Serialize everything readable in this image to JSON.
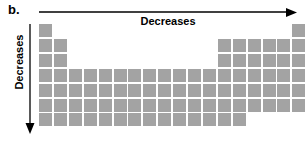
{
  "figure": {
    "panel_label": "b.",
    "horizontal_arrow": {
      "label": "Decreases",
      "direction": "right",
      "icon": "arrow-right-icon"
    },
    "vertical_arrow": {
      "label": "Decreases",
      "direction": "down",
      "icon": "arrow-down-icon"
    }
  },
  "chart_data": {
    "type": "heatmap",
    "title": "",
    "subtitle": "",
    "xlabel": "Decreases",
    "ylabel": "Decreases",
    "legend": [],
    "annotations": [
      "b.",
      "Decreases",
      "Decreases"
    ],
    "grid": false,
    "columns": 18,
    "rows": 7,
    "cell_color": "#a3a3a3",
    "background_color": "#ffffff",
    "cell_size_px": 13,
    "cell_pitch_px": 14.9,
    "origin_px": [
      39,
      24
    ],
    "row_occupancy": [
      {
        "row": 1,
        "columns": [
          1,
          18
        ]
      },
      {
        "row": 2,
        "columns": [
          1,
          2,
          13,
          14,
          15,
          16,
          17,
          18
        ]
      },
      {
        "row": 3,
        "columns": [
          1,
          2,
          13,
          14,
          15,
          16,
          17,
          18
        ]
      },
      {
        "row": 4,
        "columns": [
          1,
          2,
          3,
          4,
          5,
          6,
          7,
          8,
          9,
          10,
          11,
          12,
          13,
          14,
          15,
          16,
          17,
          18
        ]
      },
      {
        "row": 5,
        "columns": [
          1,
          2,
          3,
          4,
          5,
          6,
          7,
          8,
          9,
          10,
          11,
          12,
          13,
          14,
          15,
          16,
          17,
          18
        ]
      },
      {
        "row": 6,
        "columns": [
          1,
          2,
          3,
          4,
          5,
          6,
          7,
          8,
          9,
          10,
          11,
          12,
          13,
          14,
          15,
          16,
          17,
          18
        ]
      },
      {
        "row": 7,
        "columns": [
          1,
          2,
          3,
          4,
          5,
          6,
          7,
          8,
          9,
          10,
          11,
          12,
          13,
          14
        ]
      }
    ]
  }
}
